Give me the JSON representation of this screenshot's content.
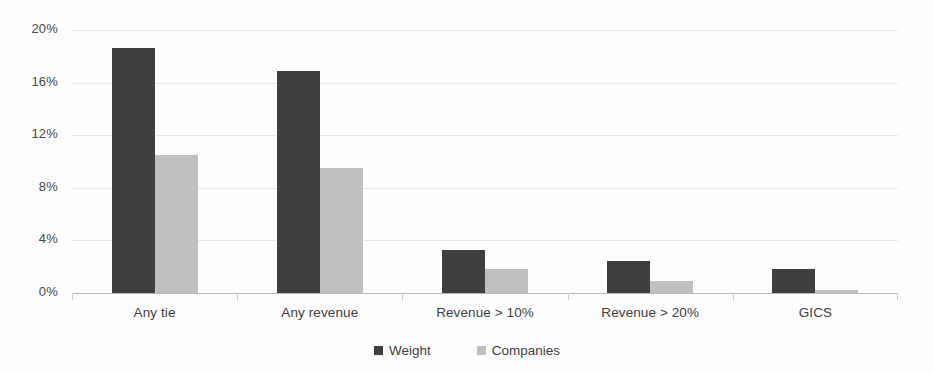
{
  "chart_data": {
    "type": "bar",
    "title": "",
    "subtitle": "",
    "xlabel": "",
    "ylabel": "",
    "grid": true,
    "legend_position": "bottom",
    "ylim": [
      0,
      20
    ],
    "yticks": [
      "0%",
      "4%",
      "8%",
      "12%",
      "16%",
      "20%"
    ],
    "ytick_values": [
      0,
      4,
      8,
      12,
      16,
      20
    ],
    "categories": [
      "Any tie",
      "Any revenue",
      "Revenue > 10%",
      "Revenue > 20%",
      "GICS"
    ],
    "series": [
      {
        "name": "Weight",
        "color": "#3f3f3f",
        "values": [
          18.6,
          16.9,
          3.3,
          2.4,
          1.8
        ]
      },
      {
        "name": "Companies",
        "color": "#c0c0c0",
        "values": [
          10.5,
          9.5,
          1.8,
          0.9,
          0.2
        ]
      }
    ]
  },
  "colors": {
    "weight": "#3f3f3f",
    "companies": "#c0c0c0",
    "gridline": "#e8e8e8",
    "axis": "#b9b9b9",
    "text": "#414141",
    "background": "#fdfdfd"
  }
}
